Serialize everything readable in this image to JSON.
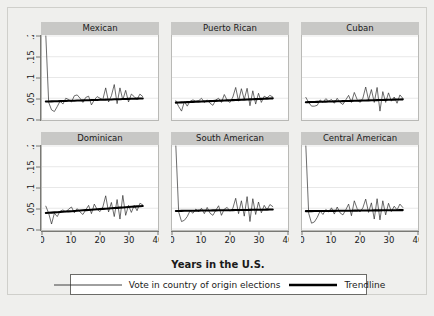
{
  "figure": {
    "xlabel": "Years in the U.S.",
    "background_color": "#efefed",
    "panel_header_color": "#c8c8c6",
    "series_color": "#2a2a2a",
    "trend_color": "#000000"
  },
  "legend": {
    "items": [
      {
        "label": "Vote in country of origin elections",
        "style": "thin-line",
        "color": "#2a2a2a"
      },
      {
        "label": "Trendline",
        "style": "thick-line",
        "color": "#000000"
      }
    ]
  },
  "chart_data": {
    "type": "line",
    "title": "",
    "subtitle": "",
    "xlabel": "Years in the U.S.",
    "ylabel": "",
    "xlim": [
      0,
      40
    ],
    "ylim": [
      0,
      0.2
    ],
    "xticks": [
      0,
      10,
      20,
      30,
      40
    ],
    "xticklabels": [
      "0",
      "10",
      "20",
      "30",
      "40"
    ],
    "yticks": [
      0,
      0.05,
      0.1,
      0.15,
      0.2
    ],
    "yticklabels": [
      "0",
      ".05",
      ".1",
      ".15",
      ".2"
    ],
    "grid": "horizontal",
    "legend_position": "bottom",
    "layout": {
      "rows": 2,
      "cols": 3
    },
    "panels": [
      {
        "name": "Mexican",
        "row": 0,
        "col": 0,
        "x": [
          1,
          2,
          3,
          4,
          5,
          6,
          7,
          8,
          9,
          10,
          11,
          12,
          13,
          14,
          15,
          16,
          17,
          18,
          19,
          20,
          21,
          22,
          23,
          24,
          25,
          26,
          27,
          28,
          29,
          30,
          31,
          32,
          33,
          34,
          35
        ],
        "series": [
          {
            "name": "Vote in country of origin elections",
            "values": [
              0.2,
              0.04,
              0.022,
              0.018,
              0.03,
              0.043,
              0.036,
              0.05,
              0.047,
              0.041,
              0.056,
              0.058,
              0.05,
              0.04,
              0.052,
              0.055,
              0.034,
              0.046,
              0.054,
              0.05,
              0.047,
              0.075,
              0.041,
              0.056,
              0.083,
              0.037,
              0.075,
              0.046,
              0.069,
              0.041,
              0.06,
              0.054,
              0.047,
              0.06,
              0.054
            ]
          },
          {
            "name": "Trendline",
            "values": [
              0.042,
              0.0422,
              0.0424,
              0.0427,
              0.0429,
              0.0431,
              0.0433,
              0.0436,
              0.0438,
              0.044,
              0.0442,
              0.0445,
              0.0447,
              0.0449,
              0.0451,
              0.0454,
              0.0456,
              0.0458,
              0.046,
              0.0463,
              0.0465,
              0.0467,
              0.0469,
              0.0472,
              0.0474,
              0.0476,
              0.0478,
              0.0481,
              0.0483,
              0.0485,
              0.0487,
              0.049,
              0.0492,
              0.0494,
              0.0496
            ]
          }
        ]
      },
      {
        "name": "Puerto Rican",
        "row": 0,
        "col": 1,
        "x": [
          1,
          2,
          3,
          4,
          5,
          6,
          7,
          8,
          9,
          10,
          11,
          12,
          13,
          14,
          15,
          16,
          17,
          18,
          19,
          20,
          21,
          22,
          23,
          24,
          25,
          26,
          27,
          28,
          29,
          30,
          31,
          32,
          33,
          34,
          35
        ],
        "series": [
          {
            "name": "Vote in country of origin elections",
            "values": [
              0.044,
              0.03,
              0.019,
              0.042,
              0.031,
              0.043,
              0.046,
              0.043,
              0.044,
              0.05,
              0.04,
              0.046,
              0.038,
              0.033,
              0.046,
              0.05,
              0.04,
              0.059,
              0.045,
              0.04,
              0.053,
              0.076,
              0.043,
              0.073,
              0.047,
              0.074,
              0.032,
              0.068,
              0.036,
              0.062,
              0.04,
              0.055,
              0.051,
              0.057,
              0.053
            ]
          },
          {
            "name": "Trendline",
            "values": [
              0.0395,
              0.0398,
              0.0401,
              0.0404,
              0.0407,
              0.041,
              0.0413,
              0.0416,
              0.0419,
              0.0422,
              0.0425,
              0.0428,
              0.0431,
              0.0434,
              0.0437,
              0.044,
              0.0443,
              0.0446,
              0.0449,
              0.0452,
              0.0455,
              0.0458,
              0.0461,
              0.0464,
              0.0467,
              0.047,
              0.0473,
              0.0476,
              0.0479,
              0.0482,
              0.0485,
              0.0488,
              0.0491,
              0.0494,
              0.0497
            ]
          }
        ]
      },
      {
        "name": "Cuban",
        "row": 0,
        "col": 2,
        "x": [
          1,
          2,
          3,
          4,
          5,
          6,
          7,
          8,
          9,
          10,
          11,
          12,
          13,
          14,
          15,
          16,
          17,
          18,
          19,
          20,
          21,
          22,
          23,
          24,
          25,
          26,
          27,
          28,
          29,
          30,
          31,
          32,
          33,
          34,
          35
        ],
        "series": [
          {
            "name": "Vote in country of origin elections",
            "values": [
              0.052,
              0.04,
              0.031,
              0.031,
              0.033,
              0.046,
              0.04,
              0.049,
              0.043,
              0.047,
              0.038,
              0.05,
              0.04,
              0.035,
              0.046,
              0.057,
              0.04,
              0.064,
              0.047,
              0.04,
              0.05,
              0.077,
              0.046,
              0.071,
              0.04,
              0.076,
              0.019,
              0.066,
              0.04,
              0.063,
              0.043,
              0.053,
              0.038,
              0.058,
              0.05
            ]
          },
          {
            "name": "Trendline",
            "values": [
              0.0405,
              0.0407,
              0.0409,
              0.0411,
              0.0413,
              0.0415,
              0.0417,
              0.0419,
              0.0421,
              0.0423,
              0.0425,
              0.0427,
              0.0429,
              0.0431,
              0.0433,
              0.0435,
              0.0437,
              0.0439,
              0.0441,
              0.0443,
              0.0445,
              0.0447,
              0.0449,
              0.0451,
              0.0453,
              0.0455,
              0.0457,
              0.0459,
              0.0461,
              0.0463,
              0.0465,
              0.0467,
              0.0469,
              0.0471,
              0.0473
            ]
          }
        ]
      },
      {
        "name": "Dominican",
        "row": 1,
        "col": 0,
        "x": [
          1,
          2,
          3,
          4,
          5,
          6,
          7,
          8,
          9,
          10,
          11,
          12,
          13,
          14,
          15,
          16,
          17,
          18,
          19,
          20,
          21,
          22,
          23,
          24,
          25,
          26,
          27,
          28,
          29,
          30,
          31,
          32,
          33,
          34,
          35
        ],
        "series": [
          {
            "name": "Vote in country of origin elections",
            "values": [
              0.055,
              0.038,
              0.012,
              0.038,
              0.03,
              0.043,
              0.046,
              0.041,
              0.048,
              0.053,
              0.039,
              0.049,
              0.041,
              0.035,
              0.046,
              0.057,
              0.037,
              0.06,
              0.047,
              0.042,
              0.053,
              0.08,
              0.041,
              0.064,
              0.03,
              0.071,
              0.024,
              0.081,
              0.033,
              0.057,
              0.04,
              0.057,
              0.044,
              0.062,
              0.058
            ]
          },
          {
            "name": "Trendline",
            "values": [
              0.0385,
              0.039,
              0.0395,
              0.04,
              0.0405,
              0.041,
              0.0415,
              0.042,
              0.0425,
              0.043,
              0.0435,
              0.044,
              0.0445,
              0.045,
              0.0455,
              0.046,
              0.0465,
              0.047,
              0.0475,
              0.048,
              0.0485,
              0.049,
              0.0495,
              0.05,
              0.0505,
              0.051,
              0.0515,
              0.052,
              0.0525,
              0.053,
              0.0535,
              0.054,
              0.0545,
              0.055,
              0.0555
            ]
          }
        ]
      },
      {
        "name": "South American",
        "row": 1,
        "col": 1,
        "x": [
          1,
          2,
          3,
          4,
          5,
          6,
          7,
          8,
          9,
          10,
          11,
          12,
          13,
          14,
          15,
          16,
          17,
          18,
          19,
          20,
          21,
          22,
          23,
          24,
          25,
          26,
          27,
          28,
          29,
          30,
          31,
          32,
          33,
          34,
          35
        ],
        "series": [
          {
            "name": "Vote in country of origin elections",
            "values": [
              0.2,
              0.041,
              0.018,
              0.021,
              0.03,
              0.044,
              0.038,
              0.048,
              0.042,
              0.05,
              0.037,
              0.052,
              0.038,
              0.033,
              0.045,
              0.056,
              0.033,
              0.048,
              0.052,
              0.043,
              0.05,
              0.074,
              0.037,
              0.068,
              0.031,
              0.078,
              0.018,
              0.073,
              0.035,
              0.065,
              0.039,
              0.057,
              0.046,
              0.059,
              0.054
            ]
          },
          {
            "name": "Trendline",
            "values": [
              0.0435,
              0.0436,
              0.0437,
              0.0438,
              0.0439,
              0.044,
              0.0441,
              0.0442,
              0.0443,
              0.0444,
              0.0445,
              0.0446,
              0.0447,
              0.0448,
              0.0449,
              0.045,
              0.0451,
              0.0452,
              0.0453,
              0.0454,
              0.0455,
              0.0456,
              0.0457,
              0.0458,
              0.0459,
              0.046,
              0.0461,
              0.0462,
              0.0463,
              0.0464,
              0.0465,
              0.0466,
              0.0467,
              0.0468,
              0.0469
            ]
          }
        ]
      },
      {
        "name": "Central American",
        "row": 1,
        "col": 2,
        "x": [
          1,
          2,
          3,
          4,
          5,
          6,
          7,
          8,
          9,
          10,
          11,
          12,
          13,
          14,
          15,
          16,
          17,
          18,
          19,
          20,
          21,
          22,
          23,
          24,
          25,
          26,
          27,
          28,
          29,
          30,
          31,
          32,
          33,
          34,
          35
        ],
        "series": [
          {
            "name": "Vote in country of origin elections",
            "values": [
              0.2,
              0.038,
              0.014,
              0.017,
              0.028,
              0.043,
              0.035,
              0.047,
              0.041,
              0.051,
              0.036,
              0.053,
              0.039,
              0.034,
              0.046,
              0.06,
              0.032,
              0.068,
              0.049,
              0.041,
              0.051,
              0.072,
              0.04,
              0.063,
              0.024,
              0.073,
              0.022,
              0.068,
              0.034,
              0.062,
              0.042,
              0.055,
              0.046,
              0.06,
              0.052
            ]
          },
          {
            "name": "Trendline",
            "values": [
              0.043,
              0.0431,
              0.0431,
              0.0432,
              0.0433,
              0.0434,
              0.0434,
              0.0435,
              0.0436,
              0.0437,
              0.0437,
              0.0438,
              0.0439,
              0.044,
              0.044,
              0.0441,
              0.0442,
              0.0443,
              0.0443,
              0.0444,
              0.0445,
              0.0446,
              0.0446,
              0.0447,
              0.0448,
              0.0449,
              0.0449,
              0.045,
              0.0451,
              0.0452,
              0.0452,
              0.0453,
              0.0454,
              0.0455,
              0.0455
            ]
          }
        ]
      }
    ]
  }
}
